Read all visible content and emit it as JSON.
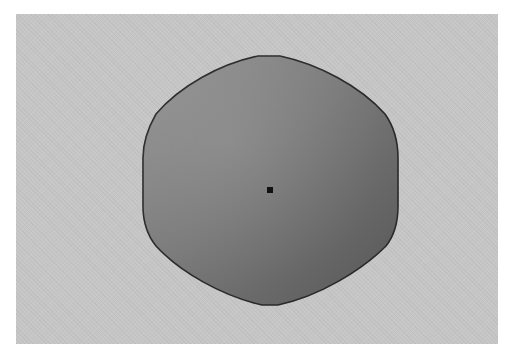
{
  "scene": {
    "description": "Rendered rounded hexagonal solid with a center point marker",
    "background_color": "#c6c6c6",
    "shape": {
      "fill_light": "#8c8c8c",
      "fill_dark": "#5a5a5a",
      "outline_color": "#2a2a2a"
    },
    "center_marker": {
      "color": "#111111",
      "x": 270,
      "y": 190
    }
  }
}
